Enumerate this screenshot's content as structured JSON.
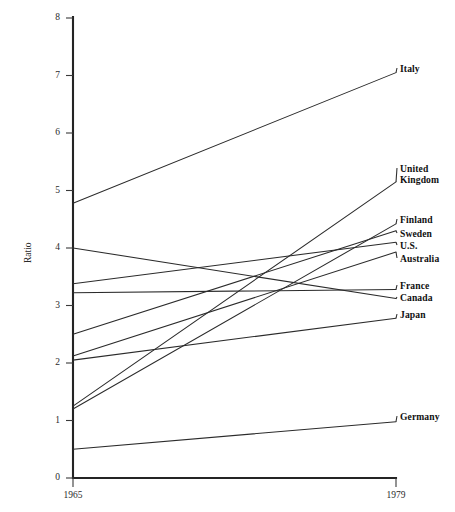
{
  "chart_data": {
    "type": "line",
    "title": "",
    "subtitle": "",
    "xlabel": "",
    "ylabel": "Ratio",
    "x": [
      1965,
      1979
    ],
    "xtick_labels": [
      "1965",
      "1979"
    ],
    "xlim": [
      1965,
      1979
    ],
    "ylim": [
      0,
      8
    ],
    "ytick_labels": [
      "0",
      "1",
      "2",
      "3",
      "4",
      "5",
      "6",
      "7",
      "8"
    ],
    "ytick_values": [
      0,
      1,
      2,
      3,
      4,
      5,
      6,
      7,
      8
    ],
    "grid": false,
    "legend_position": "right-inline-labels",
    "line_color": "#2b2b2b",
    "axis_color": "#242424",
    "series": [
      {
        "name": "Italy",
        "label": "Italy",
        "values": [
          4.78,
          7.05
        ]
      },
      {
        "name": "United Kingdom",
        "label": "United\nKingdom",
        "values": [
          1.25,
          5.15
        ]
      },
      {
        "name": "Finland",
        "label": "Finland",
        "values": [
          1.2,
          4.42
        ]
      },
      {
        "name": "Sweden",
        "label": "Sweden",
        "values": [
          2.5,
          4.3
        ]
      },
      {
        "name": "U.S.",
        "label": "U.S.",
        "values": [
          3.38,
          4.1
        ]
      },
      {
        "name": "Australia",
        "label": "Australia",
        "values": [
          2.12,
          3.93
        ]
      },
      {
        "name": "France",
        "label": "France",
        "values": [
          3.22,
          3.28
        ]
      },
      {
        "name": "Canada",
        "label": "Canada",
        "values": [
          4.0,
          3.12
        ]
      },
      {
        "name": "Japan",
        "label": "Japan",
        "values": [
          2.05,
          2.78
        ]
      },
      {
        "name": "Germany",
        "label": "Germany",
        "values": [
          0.5,
          0.98
        ]
      }
    ]
  },
  "labels": {
    "italy": "Italy",
    "united_kingdom_line1": "United",
    "united_kingdom_line2": "Kingdom",
    "finland": "Finland",
    "sweden": "Sweden",
    "us": "U.S.",
    "australia": "Australia",
    "france": "France",
    "canada": "Canada",
    "japan": "Japan",
    "germany": "Germany",
    "y_axis_title": "Ratio",
    "x_tick_left": "1965",
    "x_tick_right": "1979",
    "y_tick_0": "0",
    "y_tick_1": "1",
    "y_tick_2": "2",
    "y_tick_3": "3",
    "y_tick_4": "4",
    "y_tick_5": "5",
    "y_tick_6": "6",
    "y_tick_7": "7",
    "y_tick_8": "8"
  },
  "label_anchors": {
    "italy_y": 68,
    "uk_y": 168,
    "finland_y": 219,
    "sweden_y": 233,
    "us_y": 245,
    "australia_y": 258,
    "france_y": 285,
    "canada_y": 297,
    "japan_y": 314,
    "germany_y": 416
  }
}
